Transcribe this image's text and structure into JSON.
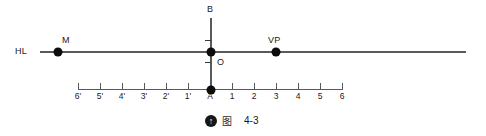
{
  "figure": {
    "type": "perspective-construction-diagram",
    "horizon_line": {
      "label": "HL",
      "label_x": 15,
      "y": 52,
      "x_start": 40,
      "x_end": 466,
      "color": "#58595b"
    },
    "vertical_line": {
      "x": 211,
      "y_top": 18,
      "y_bottom": 90,
      "color": "#58595b",
      "ticks_y": [
        40,
        62
      ]
    },
    "labeled_points": [
      {
        "name": "measuring-point-m",
        "label": "M",
        "x": 58,
        "y": 52,
        "label_x": 62,
        "label_y": 35
      },
      {
        "name": "vanishing-point-vp",
        "label": "VP",
        "x": 276,
        "y": 52,
        "label_x": 268,
        "label_y": 35
      },
      {
        "name": "point-b",
        "label": "B",
        "x": 211,
        "y": 18,
        "label_x": 207,
        "label_y": 4
      },
      {
        "name": "station-point-o",
        "label": "O",
        "x": 211,
        "y": 52,
        "label_x": 217,
        "label_y": 57
      },
      {
        "name": "origin-point-a",
        "label": "A",
        "x": 211,
        "y": 90,
        "label_x": 211,
        "label_y": 92
      }
    ],
    "ground_axis": {
      "y": 89,
      "x_start": 78,
      "x_end": 342,
      "tick_spacing": 22.2,
      "tick_labels": [
        "6'",
        "5'",
        "4'",
        "3'",
        "2'",
        "1'",
        "A",
        "1",
        "2",
        "3",
        "4",
        "5",
        "6"
      ],
      "label_y": 92,
      "color": "#58595b"
    },
    "caption": {
      "icon": "circled-up-arrow-icon",
      "icon_glyph": "↑",
      "cjk_text": "图",
      "number": "4-3"
    }
  }
}
